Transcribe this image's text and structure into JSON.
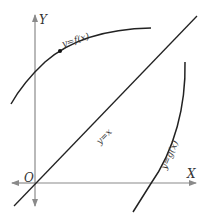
{
  "diagram": {
    "type": "function-graph",
    "axes": {
      "x_label": "X",
      "y_label": "Y",
      "origin_label": "O",
      "axis_color": "#8a8a8a"
    },
    "curves": [
      {
        "name": "f",
        "label": "y=f(x)",
        "color": "#222222"
      },
      {
        "name": "identity",
        "label": "y=x",
        "color": "#222222"
      },
      {
        "name": "g",
        "label": "y=g(x)",
        "color": "#222222"
      }
    ],
    "point": {
      "on_curve": "f",
      "color": "#111111"
    }
  }
}
